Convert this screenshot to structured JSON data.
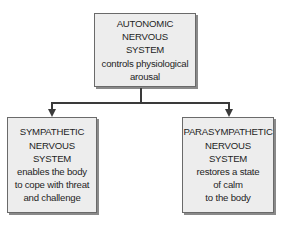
{
  "diagram": {
    "root": {
      "title_lines": [
        "AUTONOMIC",
        "NERVOUS",
        "SYSTEM"
      ],
      "desc_lines": [
        "controls physiological",
        "arousal"
      ]
    },
    "children": [
      {
        "title_lines": [
          "SYMPATHETIC",
          "NERVOUS",
          "SYSTEM"
        ],
        "desc_lines": [
          "enables the body",
          "to cope with threat",
          "and challenge"
        ]
      },
      {
        "title_lines": [
          "PARASYMPATHETIC",
          "NERVOUS",
          "SYSTEM"
        ],
        "desc_lines": [
          "restores a state",
          "of calm",
          "to the body"
        ]
      }
    ],
    "colors": {
      "box_fill": "#ededed",
      "box_border": "#6a6a6a",
      "connector": "#3a3a3a"
    }
  }
}
